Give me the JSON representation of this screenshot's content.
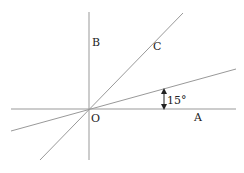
{
  "diagram": {
    "type": "geometry-angle-figure",
    "colors": {
      "line": "#999999",
      "text": "#222222",
      "arrow": "#222222",
      "background": "#ffffff"
    },
    "points": {
      "origin": {
        "label": "O",
        "x": 89,
        "y": 109
      }
    },
    "labels": {
      "A": "A",
      "B": "B",
      "C": "C",
      "O": "O",
      "angle": "15°"
    },
    "lines": [
      {
        "name": "horizontal-axis-OA",
        "x1": 11,
        "y1": 109,
        "x2": 236,
        "y2": 109
      },
      {
        "name": "vertical-axis-OB",
        "x1": 89,
        "y1": 12,
        "x2": 89,
        "y2": 160
      },
      {
        "name": "line-OC",
        "x1": 40,
        "y1": 160,
        "x2": 183,
        "y2": 13
      },
      {
        "name": "inclined-line-15deg",
        "x1": 11,
        "y1": 131,
        "x2": 236,
        "y2": 69
      }
    ],
    "angle_marker": {
      "value": "15°",
      "x": 164,
      "y_top": 89,
      "y_bottom": 109
    }
  }
}
